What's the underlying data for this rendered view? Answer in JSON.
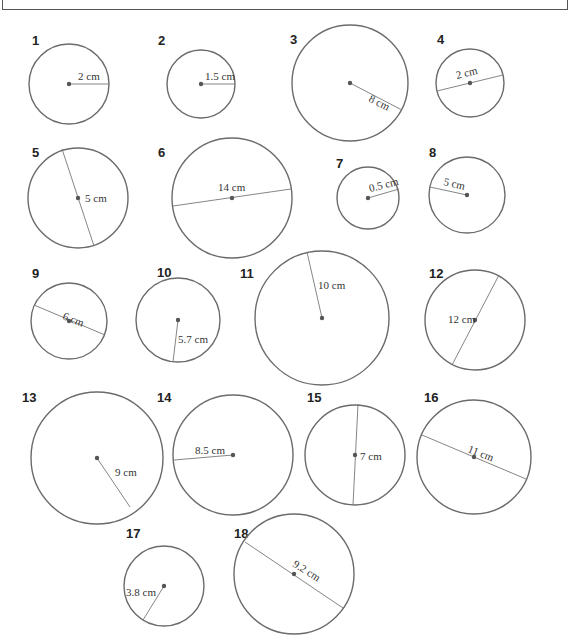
{
  "circles": [
    {
      "n": "1",
      "label": "2 cm",
      "kind": "radius",
      "cx": 69,
      "cy": 84,
      "r": 40,
      "nx": 32,
      "ny": 45,
      "x1": 69,
      "y1": 84,
      "x2": 109,
      "y2": 84,
      "lx": 78,
      "ly": 80,
      "rot": 0
    },
    {
      "n": "2",
      "label": "1.5 cm",
      "kind": "radius",
      "cx": 201,
      "cy": 84,
      "r": 34,
      "nx": 158,
      "ny": 45,
      "x1": 201,
      "y1": 84,
      "x2": 235,
      "y2": 84,
      "lx": 205,
      "ly": 80,
      "rot": 0
    },
    {
      "n": "3",
      "label": "8 cm",
      "kind": "radius",
      "cx": 350,
      "cy": 83,
      "r": 58,
      "nx": 290,
      "ny": 44,
      "x1": 350,
      "y1": 83,
      "x2": 402,
      "y2": 110,
      "lx": 368,
      "ly": 101,
      "rot": 27
    },
    {
      "n": "4",
      "label": "2 cm",
      "kind": "diameter",
      "cx": 470,
      "cy": 83,
      "r": 34,
      "nx": 437,
      "ny": 44,
      "x1": 437,
      "y1": 91,
      "x2": 503,
      "y2": 75,
      "lx": 457,
      "ly": 79,
      "rot": -14
    },
    {
      "n": "5",
      "label": "5 cm",
      "kind": "diameter",
      "cx": 78,
      "cy": 198,
      "r": 50,
      "nx": 32,
      "ny": 157,
      "x1": 62,
      "y1": 149,
      "x2": 94,
      "y2": 246,
      "lx": 85,
      "ly": 202,
      "rot": 0
    },
    {
      "n": "6",
      "label": "14 cm",
      "kind": "diameter",
      "cx": 232,
      "cy": 198,
      "r": 60,
      "nx": 158,
      "ny": 157,
      "x1": 173,
      "y1": 206,
      "x2": 291,
      "y2": 189,
      "lx": 218,
      "ly": 191,
      "rot": 0
    },
    {
      "n": "7",
      "label": "0.5 cm",
      "kind": "radius",
      "cx": 368,
      "cy": 198,
      "r": 31,
      "nx": 336,
      "ny": 168,
      "x1": 368,
      "y1": 198,
      "x2": 399,
      "y2": 189,
      "lx": 370,
      "ly": 192,
      "rot": -14
    },
    {
      "n": "8",
      "label": "5 cm",
      "kind": "radius",
      "cx": 467,
      "cy": 195,
      "r": 38,
      "nx": 429,
      "ny": 157,
      "x1": 467,
      "y1": 195,
      "x2": 430,
      "y2": 187,
      "lx": 443,
      "ly": 185,
      "rot": 13
    },
    {
      "n": "9",
      "label": "6 cm",
      "kind": "diameter",
      "cx": 69,
      "cy": 321,
      "r": 38,
      "nx": 32,
      "ny": 278,
      "x1": 34,
      "y1": 305,
      "x2": 105,
      "y2": 335,
      "lx": 62,
      "ly": 319,
      "rot": 21
    },
    {
      "n": "10",
      "label": "5.7 cm",
      "kind": "radius",
      "cx": 178,
      "cy": 320,
      "r": 42,
      "nx": 157,
      "ny": 277,
      "x1": 178,
      "y1": 320,
      "x2": 173,
      "y2": 362,
      "lx": 178,
      "ly": 343,
      "rot": 0
    },
    {
      "n": "11",
      "label": "10 cm",
      "kind": "radius",
      "cx": 322,
      "cy": 318,
      "r": 67,
      "nx": 240,
      "ny": 278,
      "x1": 322,
      "y1": 318,
      "x2": 307,
      "y2": 252,
      "lx": 318,
      "ly": 289,
      "rot": 0
    },
    {
      "n": "12",
      "label": "12 cm",
      "kind": "diameter",
      "cx": 475,
      "cy": 320,
      "r": 50,
      "nx": 429,
      "ny": 278,
      "x1": 499,
      "y1": 275,
      "x2": 452,
      "y2": 365,
      "lx": 448,
      "ly": 323,
      "rot": 0
    },
    {
      "n": "13",
      "label": "9 cm",
      "kind": "radius",
      "cx": 97,
      "cy": 458,
      "r": 66,
      "nx": 22,
      "ny": 402,
      "x1": 97,
      "y1": 458,
      "x2": 130,
      "y2": 507,
      "lx": 115,
      "ly": 476,
      "rot": 0
    },
    {
      "n": "14",
      "label": "8.5 cm",
      "kind": "radius",
      "cx": 233,
      "cy": 455,
      "r": 60,
      "nx": 157,
      "ny": 402,
      "x1": 233,
      "y1": 455,
      "x2": 174,
      "y2": 460,
      "lx": 195,
      "ly": 454,
      "rot": 0
    },
    {
      "n": "15",
      "label": "7 cm",
      "kind": "diameter",
      "cx": 355,
      "cy": 455,
      "r": 50,
      "nx": 307,
      "ny": 402,
      "x1": 358,
      "y1": 404,
      "x2": 353,
      "y2": 505,
      "lx": 360,
      "ly": 460,
      "rot": 0
    },
    {
      "n": "16",
      "label": "11 cm",
      "kind": "diameter",
      "cx": 474,
      "cy": 457,
      "r": 57,
      "nx": 424,
      "ny": 402,
      "x1": 422,
      "y1": 435,
      "x2": 526,
      "y2": 479,
      "lx": 467,
      "ly": 452,
      "rot": 21
    },
    {
      "n": "17",
      "label": "3.8 cm",
      "kind": "radius",
      "cx": 164,
      "cy": 586,
      "r": 40,
      "nx": 126,
      "ny": 538,
      "x1": 164,
      "y1": 586,
      "x2": 143,
      "y2": 620,
      "lx": 126,
      "ly": 596,
      "rot": 0
    },
    {
      "n": "18",
      "label": "9.2 cm",
      "kind": "diameter",
      "cx": 294,
      "cy": 574,
      "r": 60,
      "nx": 234,
      "ny": 538,
      "x1": 245,
      "y1": 542,
      "x2": 343,
      "y2": 608,
      "lx": 292,
      "ly": 566,
      "rot": 32
    }
  ]
}
